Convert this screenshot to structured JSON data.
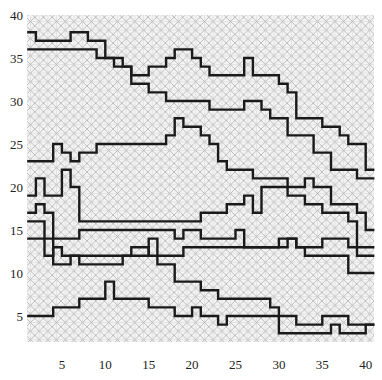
{
  "chart_data": {
    "type": "line",
    "step": "post",
    "title": "",
    "xlabel": "",
    "ylabel": "",
    "xlim": [
      1,
      41
    ],
    "ylim": [
      2,
      40
    ],
    "xticks": [
      5,
      10,
      15,
      20,
      25,
      30,
      35,
      40
    ],
    "yticks": [
      5,
      10,
      15,
      20,
      25,
      30,
      35,
      40
    ],
    "grid": true,
    "background": "cross-hatched (diagonal + orthogonal light gray hatch)",
    "legend": null,
    "line_color": "#1a1a1a",
    "x": [
      1,
      2,
      3,
      4,
      5,
      6,
      7,
      8,
      9,
      10,
      11,
      12,
      13,
      14,
      15,
      16,
      17,
      18,
      19,
      20,
      21,
      22,
      23,
      24,
      25,
      26,
      27,
      28,
      29,
      30,
      31,
      32,
      33,
      34,
      35,
      36,
      37,
      38,
      39,
      40,
      41
    ],
    "series": [
      {
        "name": "series-1",
        "values": [
          38,
          37,
          37,
          37,
          37,
          38,
          38,
          37,
          37,
          35,
          35,
          34,
          33,
          33,
          34,
          34,
          35,
          36,
          36,
          35,
          34,
          33,
          33,
          33,
          33,
          35,
          33,
          33,
          33,
          32,
          31,
          28,
          28,
          28,
          27,
          27,
          26,
          25,
          25,
          22,
          22
        ]
      },
      {
        "name": "series-2",
        "values": [
          36,
          36,
          36,
          36,
          36,
          36,
          36,
          36,
          35,
          35,
          34,
          34,
          32,
          32,
          31,
          31,
          30,
          30,
          30,
          30,
          30,
          29,
          29,
          29,
          29,
          30,
          30,
          29,
          28,
          28,
          26,
          26,
          26,
          24,
          24,
          22,
          22,
          22,
          21,
          21,
          21
        ]
      },
      {
        "name": "series-3",
        "values": [
          23,
          23,
          23,
          25,
          24,
          23,
          24,
          24,
          25,
          25,
          25,
          25,
          25,
          25,
          25,
          25,
          26,
          28,
          27,
          27,
          26,
          25,
          23,
          22,
          22,
          22,
          21,
          21,
          21,
          21,
          20,
          20,
          21,
          20,
          20,
          18,
          18,
          18,
          17,
          15,
          15
        ]
      },
      {
        "name": "series-4",
        "values": [
          19,
          21,
          19,
          19,
          22,
          20,
          16,
          16,
          16,
          16,
          16,
          16,
          16,
          16,
          16,
          16,
          16,
          16,
          16,
          16,
          17,
          17,
          17,
          18,
          18,
          19,
          17,
          20,
          20,
          20,
          19,
          19,
          18,
          18,
          17,
          17,
          17,
          16,
          13,
          13,
          13
        ]
      },
      {
        "name": "series-5",
        "values": [
          17,
          18,
          17,
          14,
          14,
          14,
          15,
          15,
          15,
          15,
          15,
          15,
          15,
          15,
          15,
          15,
          15,
          14,
          15,
          15,
          14,
          14,
          14,
          14,
          15,
          13,
          13,
          13,
          13,
          13,
          14,
          13,
          13,
          13,
          14,
          14,
          14,
          13,
          12,
          12,
          12
        ]
      },
      {
        "name": "series-6",
        "values": [
          16,
          16,
          12,
          13,
          12,
          12,
          12,
          12,
          12,
          12,
          12,
          12,
          12,
          12,
          14,
          12,
          12,
          12,
          13,
          13,
          13,
          13,
          13,
          13,
          13,
          13,
          13,
          13,
          13,
          14,
          14,
          13,
          12,
          12,
          12,
          12,
          12,
          10,
          10,
          10,
          10
        ]
      },
      {
        "name": "series-7",
        "values": [
          5,
          5,
          5,
          6,
          6,
          6,
          7,
          7,
          7,
          9,
          7,
          7,
          7,
          7,
          6,
          6,
          6,
          5,
          5,
          6,
          5,
          5,
          4,
          5,
          5,
          5,
          5,
          5,
          5,
          3,
          3,
          3,
          3,
          3,
          3,
          4,
          3,
          3,
          3,
          4,
          4
        ]
      },
      {
        "name": "series-8",
        "values": [
          14,
          14,
          14,
          11,
          11,
          12,
          11,
          11,
          11,
          11,
          11,
          12,
          13,
          13,
          12,
          11,
          11,
          9,
          9,
          9,
          8,
          8,
          7,
          7,
          7,
          7,
          7,
          7,
          6,
          5,
          5,
          4,
          4,
          4,
          5,
          5,
          5,
          4,
          4,
          4,
          4
        ]
      }
    ]
  }
}
